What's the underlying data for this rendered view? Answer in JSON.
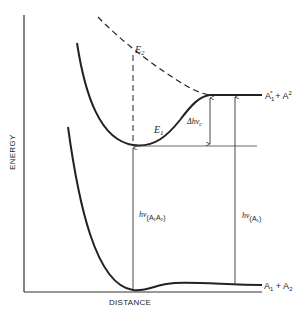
{
  "diagram": {
    "type": "potential-energy-curves",
    "axes": {
      "x_label": "DISTANCE",
      "y_label": "ENERGY"
    },
    "curves": {
      "upper_state": {
        "label": "E",
        "label_sub": "1",
        "style": "solid"
      },
      "excited_repulsive": {
        "label": "E",
        "label_sub": "2",
        "style": "dashed"
      },
      "ground_state": {
        "style": "solid"
      }
    },
    "asymptotes": {
      "upper": {
        "main": "A",
        "sub": "1",
        "sup": "*",
        "plus": " + A",
        "sup2": "2"
      },
      "lower": {
        "main": "A",
        "sub": "1",
        "plus": " + A",
        "sub2": "2"
      }
    },
    "transitions": {
      "complex": {
        "h": "hν",
        "sub": "(A₁A₂)"
      },
      "delta": {
        "prefix": "Δhν",
        "sub": "c"
      },
      "atomic": {
        "h": "hν",
        "sub": "(A₁)"
      }
    },
    "colors": {
      "ink": "#222222",
      "background": "#ffffff"
    }
  }
}
